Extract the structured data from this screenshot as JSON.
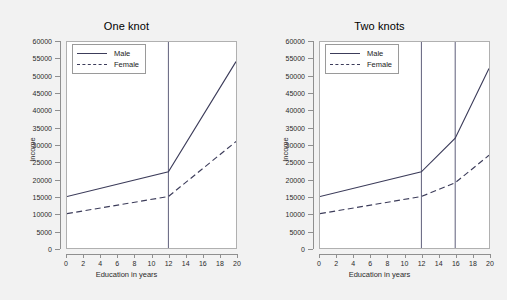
{
  "figure": {
    "background_color": "#f2f2f2",
    "plot_background_color": "#ffffff",
    "line_color": "#3c3c5a",
    "knot_line_color": "#4a4a6a",
    "axis_color": "#8f8f8f"
  },
  "axis": {
    "xlabel": "Education in years",
    "ylabel": "Income",
    "xticks": [
      "0",
      "2",
      "4",
      "6",
      "8",
      "10",
      "12",
      "14",
      "16",
      "18",
      "20"
    ],
    "yticks": [
      "0",
      "5000",
      "10000",
      "15000",
      "20000",
      "25000",
      "30000",
      "35000",
      "40000",
      "45000",
      "50000",
      "55000",
      "60000"
    ]
  },
  "legend": {
    "male_label": "Male",
    "female_label": "Female"
  },
  "chart_data": [
    {
      "type": "line",
      "title": "One knot",
      "xlabel": "Education in years",
      "ylabel": "Income",
      "xlim": [
        0,
        20
      ],
      "ylim": [
        0,
        60000
      ],
      "xticks": [
        0,
        2,
        4,
        6,
        8,
        10,
        12,
        14,
        16,
        18,
        20
      ],
      "yticks": [
        0,
        5000,
        10000,
        15000,
        20000,
        25000,
        30000,
        35000,
        40000,
        45000,
        50000,
        55000,
        60000
      ],
      "grid": false,
      "legend_position": "top-left",
      "knots": [
        12
      ],
      "series": [
        {
          "name": "Male",
          "style": "solid",
          "x": [
            0,
            12,
            20
          ],
          "values": [
            15000,
            22200,
            54300
          ]
        },
        {
          "name": "Female",
          "style": "dashed",
          "x": [
            0,
            12,
            20
          ],
          "values": [
            10000,
            15000,
            31000
          ]
        }
      ]
    },
    {
      "type": "line",
      "title": "Two knots",
      "xlabel": "Education in years",
      "ylabel": "Income",
      "xlim": [
        0,
        20
      ],
      "ylim": [
        0,
        60000
      ],
      "xticks": [
        0,
        2,
        4,
        6,
        8,
        10,
        12,
        14,
        16,
        18,
        20
      ],
      "yticks": [
        0,
        5000,
        10000,
        15000,
        20000,
        25000,
        30000,
        35000,
        40000,
        45000,
        50000,
        55000,
        60000
      ],
      "grid": false,
      "legend_position": "top-left",
      "knots": [
        12,
        16
      ],
      "series": [
        {
          "name": "Male",
          "style": "solid",
          "x": [
            0,
            12,
            16,
            20
          ],
          "values": [
            15000,
            22200,
            32000,
            52300
          ]
        },
        {
          "name": "Female",
          "style": "dashed",
          "x": [
            0,
            12,
            16,
            20
          ],
          "values": [
            10000,
            15000,
            19000,
            27000
          ]
        }
      ]
    }
  ]
}
